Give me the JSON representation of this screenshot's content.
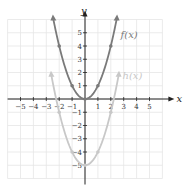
{
  "chart_data": {
    "type": "line",
    "title": "",
    "xlabel": "x",
    "ylabel": "y",
    "xlim": [
      -6,
      6
    ],
    "ylim": [
      -6,
      6
    ],
    "grid": true,
    "x_ticks": [
      -5,
      -4,
      -3,
      -2,
      -1,
      1,
      2,
      3,
      4,
      5
    ],
    "y_ticks": [
      -5,
      -4,
      -3,
      -2,
      -1,
      1,
      2,
      3,
      4,
      5
    ],
    "series": [
      {
        "name": "f(x)",
        "label": "f(x)",
        "color": "#7a7a7a",
        "expression": "x^2",
        "points": [
          [
            -2,
            4
          ],
          [
            -1,
            1
          ],
          [
            0,
            0
          ],
          [
            1,
            1
          ],
          [
            2,
            4
          ]
        ],
        "domain": [
          -2.45,
          2.45
        ]
      },
      {
        "name": "h(x)",
        "label": "h(x)",
        "color": "#c8c8c8",
        "expression": "x^2 - 5",
        "points": [
          [
            -2,
            -1
          ],
          [
            -1,
            -4
          ],
          [
            0,
            -5
          ],
          [
            1,
            -4
          ],
          [
            2,
            -1
          ]
        ],
        "domain": [
          -2.6,
          2.6
        ]
      }
    ]
  },
  "colors": {
    "axis": "#222222",
    "grid": "#e6e6e6",
    "tick_label": "#333333"
  }
}
